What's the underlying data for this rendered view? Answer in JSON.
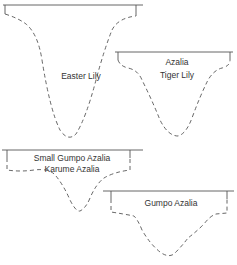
{
  "diagram": {
    "type": "root-zone-profiles",
    "colors": {
      "line": "#555555",
      "text": "#333333",
      "background": "#ffffff"
    },
    "profiles": [
      {
        "id": "easter-lily",
        "labels": [
          "Easter Lily"
        ]
      },
      {
        "id": "azalia-tiger-lily",
        "labels": [
          "Azalia",
          "Tiger Lily"
        ]
      },
      {
        "id": "small-gumpo-karume",
        "labels": [
          "Small Gumpo Azalia",
          "Karume Azalia"
        ]
      },
      {
        "id": "gumpo-azalia",
        "labels": [
          "Gumpo Azalia"
        ]
      }
    ]
  }
}
